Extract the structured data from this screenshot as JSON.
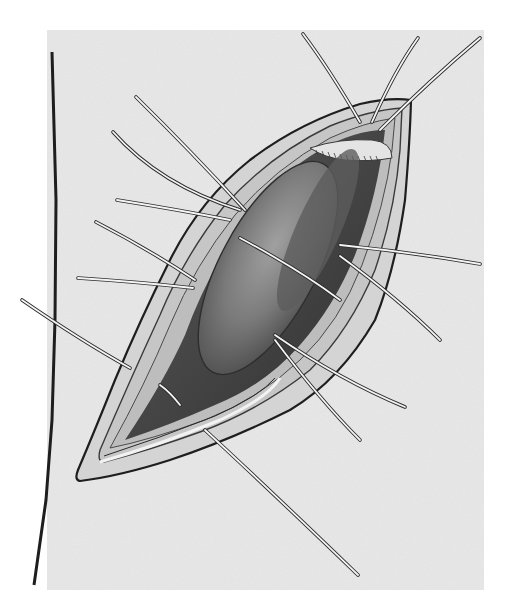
{
  "image": {
    "description": "Grayscale surgical illustration of an elongated diagonal incision with retracted layered wound edges, exposing an oval organ inside; multiple stay sutures radiate outward from both margins",
    "colors": {
      "background": "#ffffff",
      "paper": "#e9e9e9",
      "outline": "#1e1e1e",
      "wound_edge": "#d8d8d8",
      "cavity_dark": "#4a4a4a",
      "organ": "#7e7e7e",
      "organ_highlight": "#9a9a9a",
      "suture": "#f4f4f4"
    },
    "elements": [
      "skin-boundary-line",
      "incision-outline",
      "wound-margin-layers",
      "exposed-organ",
      "stay-sutures"
    ],
    "suture_count": 14
  }
}
